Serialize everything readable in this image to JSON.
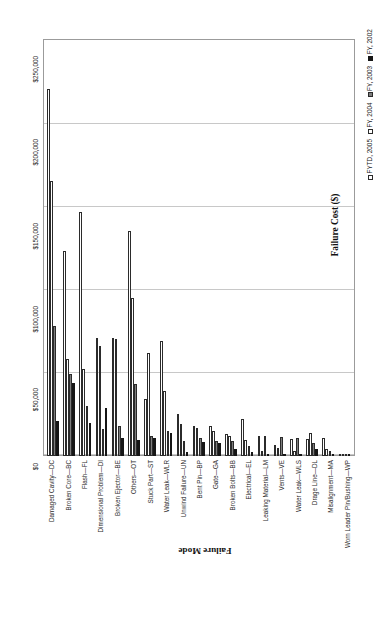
{
  "chart_data": {
    "type": "bar",
    "title": "",
    "xlabel": "Failure Mode",
    "ylabel": "Failure Cost ($)",
    "ylim": [
      0,
      250000
    ],
    "grid": true,
    "legend_position": "bottom-right-rotated",
    "yticks": [
      "$0",
      "$50,000",
      "$100,000",
      "$150,000",
      "$200,000",
      "$250,000"
    ],
    "ytick_values": [
      0,
      50000,
      100000,
      150000,
      200000,
      250000
    ],
    "categories": [
      "Damaged Cavity—DC",
      "Broken Core—BC",
      "Flash—FL",
      "Dimensional Problem—DI",
      "Broken Ejector—BE",
      "Others—OT",
      "Stuck Part—ST",
      "Water Leak—WLR",
      "Unwind Failure—UN",
      "Bent Pin—BP",
      "Gate—GA",
      "Broken Bolts—BB",
      "Electrical—EL",
      "Leaking Material—LM",
      "Vents—VE",
      "Water Leak—WLS",
      "Drage Line—DL",
      "Misalignment—MA",
      "Worn Leader Pin/Bushing—WP"
    ],
    "series": [
      {
        "name": "FYTD, 2005",
        "color": "#ffffff",
        "values": [
          220000,
          123000,
          146000,
          71000,
          71000,
          135000,
          34000,
          69000,
          25000,
          18000,
          18000,
          13000,
          22000,
          12000,
          6500,
          10000,
          10000,
          11000,
          1200
        ]
      },
      {
        "name": "FY, 2004",
        "color": "#ffffff",
        "values": [
          165000,
          58000,
          52000,
          66000,
          70000,
          95000,
          62000,
          39000,
          19000,
          17000,
          15000,
          12000,
          9500,
          3000,
          4800,
          3000,
          14000,
          4000,
          900
        ]
      },
      {
        "name": "FY, 2003",
        "color": "#7d7d7d",
        "values": [
          78000,
          49000,
          30000,
          16000,
          18000,
          43000,
          12000,
          15000,
          9000,
          11000,
          9000,
          9000,
          6000,
          12000,
          11500,
          11000,
          8000,
          3200,
          700
        ]
      },
      {
        "name": "FY, 2002",
        "color": "#161616",
        "values": [
          21000,
          44000,
          20000,
          29000,
          11000,
          9500,
          11000,
          14000,
          2500,
          8500,
          8000,
          4500,
          2500,
          1500,
          1500,
          1200,
          4500,
          1000,
          400
        ]
      }
    ]
  },
  "axis_titles": {
    "x": "Failure Mode",
    "y": "Failure Cost ($)"
  }
}
